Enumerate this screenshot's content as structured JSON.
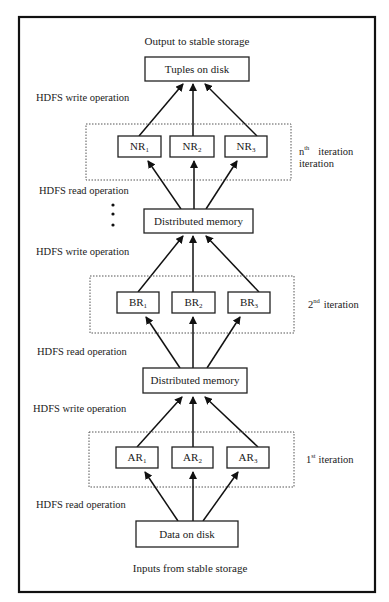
{
  "diagram": {
    "top_caption": "Output to stable storage",
    "bottom_caption": "Inputs from stable storage",
    "output_node": "Tuples on disk",
    "input_node": "Data on disk",
    "memory_nodes": [
      "Distributed memory",
      "Distributed memory"
    ],
    "operations": {
      "write_top": "HDFS write operation",
      "read_nth": "HDFS read operation",
      "write_2nd": "HDFS write operation",
      "read_2nd": "HDFS read operation",
      "write_1st": "HDFS write operation",
      "read_1st": "HDFS read operation"
    },
    "iterations": [
      {
        "id": "nth",
        "label_prefix": "n",
        "label_sup": "th",
        "label_main": "iteration",
        "label_line2": "iteration",
        "nodes": [
          {
            "base": "NR",
            "sub": "1"
          },
          {
            "base": "NR",
            "sub": "2"
          },
          {
            "base": "NR",
            "sub": "3"
          }
        ]
      },
      {
        "id": "2nd",
        "label_prefix": "2",
        "label_sup": "nd",
        "label_main": "iteration",
        "nodes": [
          {
            "base": "BR",
            "sub": "1"
          },
          {
            "base": "BR",
            "sub": "2"
          },
          {
            "base": "BR",
            "sub": "3"
          }
        ]
      },
      {
        "id": "1st",
        "label_prefix": "1",
        "label_sup": "st",
        "label_main": "iteration",
        "nodes": [
          {
            "base": "AR",
            "sub": "1"
          },
          {
            "base": "AR",
            "sub": "2"
          },
          {
            "base": "AR",
            "sub": "3"
          }
        ]
      }
    ],
    "ellipsis": "⋮"
  }
}
